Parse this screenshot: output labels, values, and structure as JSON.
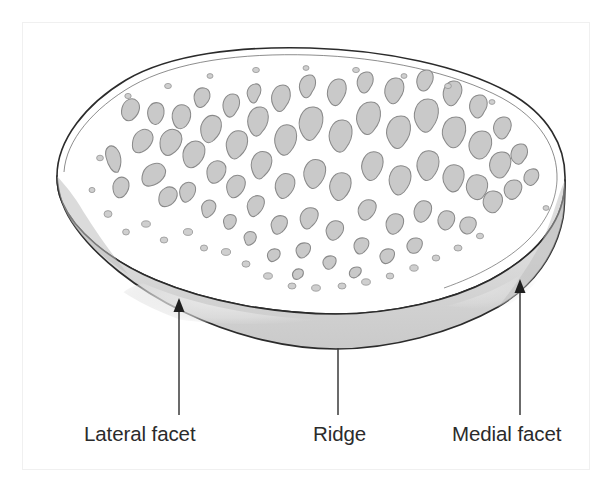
{
  "figure": {
    "background_color": "#ffffff",
    "frame_color": "#f0f0f0",
    "outline_color": "#2b2b2b",
    "facet_band_color": "#d5d5d5",
    "facet_highlight_color": "#e8e8e8",
    "trabecula_fill_color": "#c9c9c9",
    "trabecula_stroke_color": "#8a8a8a",
    "label_color": "#2b2b2b",
    "leader_color": "#3a3a3a"
  },
  "labels": [
    {
      "id": "lateral-facet",
      "text": "Lateral facet",
      "leader": {
        "type": "arrow",
        "x": 179,
        "y_tip": 300,
        "y_base": 415
      }
    },
    {
      "id": "ridge",
      "text": "Ridge",
      "leader": {
        "type": "line",
        "x": 338,
        "y_tip": 348,
        "y_base": 415
      }
    },
    {
      "id": "medial-facet",
      "text": "Medial facet",
      "leader": {
        "type": "arrow",
        "x": 520,
        "y_tip": 281,
        "y_base": 415
      }
    }
  ]
}
